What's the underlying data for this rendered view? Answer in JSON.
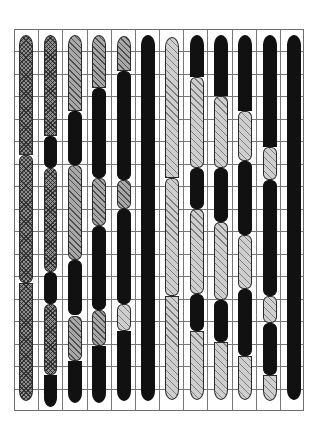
{
  "figure": {
    "type": "chromosome-ideogram",
    "title": "",
    "background_color": "#ffffff",
    "frame_color": "#6e6e6e",
    "grid_line_color": "#77777b"
  },
  "chart_data": {
    "type": "bar",
    "title": "",
    "xlabel": "",
    "ylabel": "",
    "grid": true,
    "legend": null,
    "xlim": [
      0,
      12
    ],
    "ylim": [
      0,
      17
    ],
    "categories": [
      "1",
      "2",
      "3",
      "4",
      "5",
      "6",
      "7",
      "8",
      "9",
      "10",
      "11",
      "12"
    ],
    "values": [
      16.2,
      16.6,
      16.2,
      16.4,
      16.5,
      16.0,
      15.6,
      15.8,
      15.7,
      15.6,
      16.1,
      15.9
    ],
    "grid_columns": 12,
    "grid_rows": 17,
    "fill_palette": {
      "black": "#111111",
      "dark_crosshatch": "#8d8d8d",
      "medium_hatch": "#a8a8a8",
      "light_hatch": "#cfcfcf",
      "white": "#f2f2f2"
    },
    "series": [
      {
        "name": "1",
        "x_center_pct": 4.2,
        "width_pct": 4.8,
        "top_pct": 1.5,
        "bottom_pct": 97.5,
        "segments": [
          {
            "start": 1.5,
            "end": 33.0,
            "fill": "dark_crosshatch",
            "pattern": "cross"
          },
          {
            "start": 33.0,
            "end": 66.5,
            "fill": "dark_crosshatch",
            "pattern": "cross"
          },
          {
            "start": 66.5,
            "end": 97.5,
            "fill": "dark_crosshatch",
            "pattern": "cross"
          }
        ]
      },
      {
        "name": "2",
        "x_center_pct": 12.6,
        "width_pct": 4.8,
        "top_pct": 1.5,
        "bottom_pct": 99.0,
        "segments": [
          {
            "start": 1.5,
            "end": 28.0,
            "fill": "dark_crosshatch",
            "pattern": "cross"
          },
          {
            "start": 28.0,
            "end": 36.5,
            "fill": "black",
            "pattern": "none"
          },
          {
            "start": 36.5,
            "end": 63.5,
            "fill": "dark_crosshatch",
            "pattern": "cross"
          },
          {
            "start": 63.5,
            "end": 72.0,
            "fill": "black",
            "pattern": "none"
          },
          {
            "start": 72.0,
            "end": 90.5,
            "fill": "dark_crosshatch",
            "pattern": "cross"
          },
          {
            "start": 90.5,
            "end": 99.0,
            "fill": "black",
            "pattern": "none"
          }
        ]
      },
      {
        "name": "3",
        "x_center_pct": 21.0,
        "width_pct": 4.8,
        "top_pct": 1.5,
        "bottom_pct": 97.8,
        "segments": [
          {
            "start": 1.5,
            "end": 21.5,
            "fill": "medium_hatch",
            "pattern": "diag"
          },
          {
            "start": 21.5,
            "end": 35.5,
            "fill": "black",
            "pattern": "none"
          },
          {
            "start": 35.5,
            "end": 60.5,
            "fill": "medium_hatch",
            "pattern": "diag"
          },
          {
            "start": 60.5,
            "end": 75.0,
            "fill": "black",
            "pattern": "none"
          },
          {
            "start": 75.0,
            "end": 87.0,
            "fill": "medium_hatch",
            "pattern": "diag"
          },
          {
            "start": 87.0,
            "end": 97.8,
            "fill": "black",
            "pattern": "none"
          }
        ]
      },
      {
        "name": "4",
        "x_center_pct": 29.4,
        "width_pct": 4.8,
        "top_pct": 1.5,
        "bottom_pct": 98.0,
        "segments": [
          {
            "start": 1.5,
            "end": 15.5,
            "fill": "medium_hatch",
            "pattern": "diag"
          },
          {
            "start": 15.5,
            "end": 39.0,
            "fill": "black",
            "pattern": "none"
          },
          {
            "start": 39.0,
            "end": 51.5,
            "fill": "medium_hatch",
            "pattern": "diag"
          },
          {
            "start": 51.5,
            "end": 73.5,
            "fill": "black",
            "pattern": "none"
          },
          {
            "start": 73.5,
            "end": 83.0,
            "fill": "medium_hatch",
            "pattern": "diag"
          },
          {
            "start": 83.0,
            "end": 98.0,
            "fill": "black",
            "pattern": "none"
          }
        ]
      },
      {
        "name": "5",
        "x_center_pct": 37.8,
        "width_pct": 4.8,
        "top_pct": 1.8,
        "bottom_pct": 97.5,
        "segments": [
          {
            "start": 1.8,
            "end": 11.0,
            "fill": "medium_hatch",
            "pattern": "diag"
          },
          {
            "start": 11.0,
            "end": 39.5,
            "fill": "black",
            "pattern": "none"
          },
          {
            "start": 39.5,
            "end": 47.0,
            "fill": "medium_hatch",
            "pattern": "diag"
          },
          {
            "start": 47.0,
            "end": 72.0,
            "fill": "black",
            "pattern": "none"
          },
          {
            "start": 72.0,
            "end": 79.0,
            "fill": "light_hatch",
            "pattern": "diag-light"
          },
          {
            "start": 79.0,
            "end": 97.5,
            "fill": "black",
            "pattern": "none"
          }
        ]
      },
      {
        "name": "6",
        "x_center_pct": 46.2,
        "width_pct": 4.8,
        "top_pct": 1.5,
        "bottom_pct": 97.5,
        "segments": [
          {
            "start": 1.5,
            "end": 97.5,
            "fill": "black",
            "pattern": "none"
          }
        ]
      },
      {
        "name": "7",
        "x_center_pct": 54.6,
        "width_pct": 4.8,
        "top_pct": 2.0,
        "bottom_pct": 97.0,
        "segments": [
          {
            "start": 2.0,
            "end": 39.0,
            "fill": "light_hatch",
            "pattern": "diag-light"
          },
          {
            "start": 39.0,
            "end": 70.0,
            "fill": "light_hatch",
            "pattern": "diag-light"
          },
          {
            "start": 70.0,
            "end": 97.0,
            "fill": "light_hatch",
            "pattern": "diag-light"
          }
        ]
      },
      {
        "name": "8",
        "x_center_pct": 63.0,
        "width_pct": 4.8,
        "top_pct": 1.5,
        "bottom_pct": 97.2,
        "segments": [
          {
            "start": 1.5,
            "end": 12.5,
            "fill": "black",
            "pattern": "none"
          },
          {
            "start": 12.5,
            "end": 36.5,
            "fill": "light_hatch",
            "pattern": "diag-light"
          },
          {
            "start": 36.5,
            "end": 47.0,
            "fill": "black",
            "pattern": "none"
          },
          {
            "start": 47.0,
            "end": 69.5,
            "fill": "light_hatch",
            "pattern": "diag-light"
          },
          {
            "start": 69.5,
            "end": 79.0,
            "fill": "black",
            "pattern": "none"
          },
          {
            "start": 79.0,
            "end": 97.2,
            "fill": "light_hatch",
            "pattern": "diag-light"
          }
        ]
      },
      {
        "name": "9",
        "x_center_pct": 71.4,
        "width_pct": 4.8,
        "top_pct": 1.5,
        "bottom_pct": 97.0,
        "segments": [
          {
            "start": 1.5,
            "end": 17.5,
            "fill": "black",
            "pattern": "none"
          },
          {
            "start": 17.5,
            "end": 36.5,
            "fill": "light_hatch",
            "pattern": "diag-light"
          },
          {
            "start": 36.5,
            "end": 50.5,
            "fill": "black",
            "pattern": "none"
          },
          {
            "start": 50.5,
            "end": 71.0,
            "fill": "light_hatch",
            "pattern": "diag-light"
          },
          {
            "start": 71.0,
            "end": 82.0,
            "fill": "black",
            "pattern": "none"
          },
          {
            "start": 82.0,
            "end": 97.0,
            "fill": "light_hatch",
            "pattern": "diag-light"
          }
        ]
      },
      {
        "name": "10",
        "x_center_pct": 79.8,
        "width_pct": 4.8,
        "top_pct": 1.5,
        "bottom_pct": 97.0,
        "segments": [
          {
            "start": 1.5,
            "end": 21.5,
            "fill": "black",
            "pattern": "none"
          },
          {
            "start": 21.5,
            "end": 34.5,
            "fill": "light_hatch",
            "pattern": "diag-light"
          },
          {
            "start": 34.5,
            "end": 54.0,
            "fill": "black",
            "pattern": "none"
          },
          {
            "start": 54.0,
            "end": 68.0,
            "fill": "light_hatch",
            "pattern": "diag-light"
          },
          {
            "start": 68.0,
            "end": 85.5,
            "fill": "black",
            "pattern": "none"
          },
          {
            "start": 85.5,
            "end": 97.0,
            "fill": "light_hatch",
            "pattern": "diag-light"
          }
        ]
      },
      {
        "name": "11",
        "x_center_pct": 88.2,
        "width_pct": 4.8,
        "top_pct": 1.5,
        "bottom_pct": 97.5,
        "segments": [
          {
            "start": 1.5,
            "end": 31.0,
            "fill": "black",
            "pattern": "none"
          },
          {
            "start": 31.0,
            "end": 39.5,
            "fill": "light_hatch",
            "pattern": "diag-light"
          },
          {
            "start": 39.5,
            "end": 70.0,
            "fill": "black",
            "pattern": "none"
          },
          {
            "start": 70.0,
            "end": 77.0,
            "fill": "light_hatch",
            "pattern": "diag-light"
          },
          {
            "start": 77.0,
            "end": 90.5,
            "fill": "black",
            "pattern": "none"
          },
          {
            "start": 90.5,
            "end": 97.5,
            "fill": "light_hatch",
            "pattern": "diag-light"
          }
        ]
      },
      {
        "name": "12",
        "x_center_pct": 96.4,
        "width_pct": 4.8,
        "top_pct": 1.5,
        "bottom_pct": 97.0,
        "segments": [
          {
            "start": 1.5,
            "end": 97.0,
            "fill": "black",
            "pattern": "none"
          }
        ]
      }
    ]
  }
}
